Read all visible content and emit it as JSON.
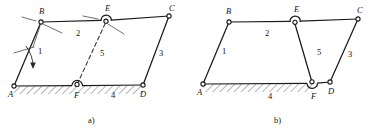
{
  "figure": {
    "stroke_color": "#1a1a1a",
    "background_color": "#ffffff",
    "panels": [
      {
        "id": "a",
        "caption": "a)",
        "caption_pos": {
          "x": 88,
          "y": 123
        },
        "joints": [
          {
            "name": "A",
            "label": "A",
            "x": 14,
            "y": 86,
            "type": "pin-ground",
            "label_pos": {
              "x": 8,
              "y": 97
            }
          },
          {
            "name": "B",
            "label": "B",
            "x": 41,
            "y": 22,
            "type": "pin",
            "label_pos": {
              "x": 39,
              "y": 14
            }
          },
          {
            "name": "C",
            "label": "C",
            "x": 169,
            "y": 16,
            "type": "pin",
            "label_pos": {
              "x": 169,
              "y": 11
            }
          },
          {
            "name": "D",
            "label": "D",
            "x": 143,
            "y": 85,
            "type": "pin-ground",
            "label_pos": {
              "x": 140,
              "y": 97
            }
          },
          {
            "name": "E",
            "label": "E",
            "x": 106,
            "y": 21,
            "type": "pin-arc-up",
            "label_pos": {
              "x": 105,
              "y": 11
            }
          },
          {
            "name": "F",
            "label": "F",
            "x": 77,
            "y": 85,
            "type": "pin-arc-up-ground",
            "label_pos": {
              "x": 74,
              "y": 98
            }
          }
        ],
        "links": [
          {
            "number": "1",
            "label": "1",
            "from": "A",
            "to": "B",
            "style": "solid",
            "label_pos": {
              "x": 38,
              "y": 54
            }
          },
          {
            "number": "2",
            "label": "2",
            "from": "B",
            "to": "C",
            "style": "solid",
            "label_pos": {
              "x": 76,
              "y": 36
            }
          },
          {
            "number": "3",
            "label": "3",
            "from": "C",
            "to": "D",
            "style": "solid",
            "label_pos": {
              "x": 159,
              "y": 56
            }
          },
          {
            "number": "4",
            "label": "4",
            "from": "F",
            "to": "D",
            "style": "ground",
            "label_pos": {
              "x": 111,
              "y": 98
            }
          },
          {
            "number": "5",
            "label": "5",
            "from": "E",
            "to": "F",
            "style": "dashed",
            "label_pos": {
              "x": 100,
              "y": 56
            }
          }
        ],
        "ground": {
          "x1": 14,
          "y1": 86,
          "x2": 143,
          "y2": 85,
          "hatched": true
        },
        "annotations": [
          {
            "type": "curved-arrow",
            "near": "A",
            "note": "rotation arrow on link 1"
          },
          {
            "type": "leader",
            "near": "B",
            "note": "leader ticks at joint B"
          },
          {
            "type": "leader",
            "near": "E",
            "note": "leader ticks at joint E"
          }
        ]
      },
      {
        "id": "b",
        "caption": "b)",
        "caption_pos": {
          "x": 274,
          "y": 123
        },
        "joints": [
          {
            "name": "A",
            "label": "A",
            "x": 203,
            "y": 84,
            "type": "pin-ground",
            "label_pos": {
              "x": 197,
              "y": 95
            }
          },
          {
            "name": "B",
            "label": "B",
            "x": 229,
            "y": 22,
            "type": "pin",
            "label_pos": {
              "x": 226,
              "y": 14
            }
          },
          {
            "name": "C",
            "label": "C",
            "x": 358,
            "y": 19,
            "type": "pin",
            "label_pos": {
              "x": 357,
              "y": 13
            }
          },
          {
            "name": "D",
            "label": "D",
            "x": 330,
            "y": 82,
            "type": "pin-ground",
            "label_pos": {
              "x": 328,
              "y": 94
            }
          },
          {
            "name": "E",
            "label": "E",
            "x": 295,
            "y": 22,
            "type": "pin-arc-up",
            "label_pos": {
              "x": 294,
              "y": 12
            }
          },
          {
            "name": "F",
            "label": "F",
            "x": 312,
            "y": 83,
            "type": "pin-arc-down-ground",
            "label_pos": {
              "x": 311,
              "y": 99
            }
          }
        ],
        "links": [
          {
            "number": "1",
            "label": "1",
            "from": "A",
            "to": "B",
            "style": "solid",
            "label_pos": {
              "x": 222,
              "y": 54
            }
          },
          {
            "number": "2",
            "label": "2",
            "from": "B",
            "to": "C",
            "style": "solid",
            "label_pos": {
              "x": 265,
              "y": 36
            }
          },
          {
            "number": "3",
            "label": "3",
            "from": "C",
            "to": "D",
            "style": "solid",
            "label_pos": {
              "x": 348,
              "y": 57
            }
          },
          {
            "number": "4",
            "label": "4",
            "from": "A",
            "to": "F",
            "style": "ground",
            "label_pos": {
              "x": 268,
              "y": 99
            }
          },
          {
            "number": "5",
            "label": "5",
            "from": "E",
            "to": "F",
            "style": "solid",
            "label_pos": {
              "x": 317,
              "y": 55
            }
          }
        ],
        "ground": {
          "x1": 203,
          "y1": 84,
          "x2": 312,
          "y2": 83,
          "hatched": true
        },
        "annotations": []
      }
    ]
  }
}
